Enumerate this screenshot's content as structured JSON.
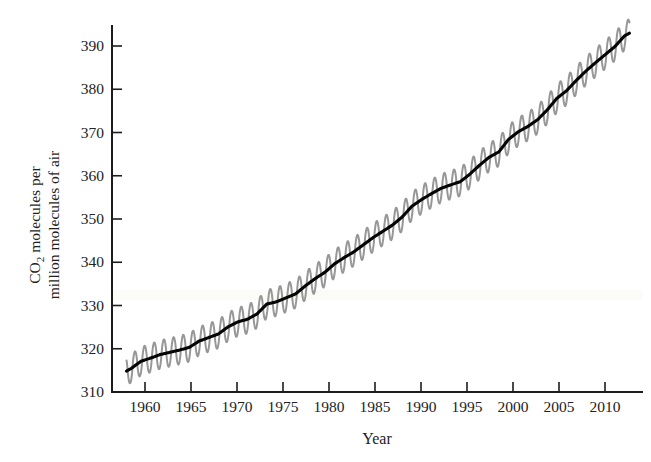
{
  "figure": {
    "background_color": "#ffffff",
    "trend_color": "#050505",
    "seasonal_color": "#8e8e8e",
    "axis_color": "#1c1c1c"
  },
  "labels": {
    "xlabel": "Year",
    "ylabel_line1": "CO2 molecules per",
    "ylabel_line2": "million molecules of air",
    "ylabel_rich_prefix": "CO",
    "ylabel_rich_sub": "2",
    "ylabel_rich_suffix": " molecules per"
  },
  "axes": {
    "y_ticks": [
      310,
      320,
      330,
      340,
      350,
      360,
      370,
      380,
      390
    ],
    "x_ticks": [
      1960,
      1965,
      1970,
      1975,
      1980,
      1985,
      1990,
      1995,
      2000,
      2005,
      2010
    ],
    "xlim": [
      1957.0,
      2011.8
    ],
    "ylim": [
      310,
      392
    ],
    "grid": false,
    "legend": "none"
  },
  "chart_data": {
    "type": "line",
    "title": "",
    "xlabel": "Year",
    "ylabel": "CO2 molecules per million molecules of air",
    "xlim": [
      1957.0,
      2011.8
    ],
    "ylim": [
      310,
      392
    ],
    "grid": false,
    "legend_position": "none",
    "x_tick_labels": [
      "1960",
      "1965",
      "1970",
      "1975",
      "1980",
      "1985",
      "1990",
      "1995",
      "2000",
      "2005",
      "2010"
    ],
    "y_tick_labels": [
      "310",
      "320",
      "330",
      "340",
      "350",
      "360",
      "370",
      "380",
      "390"
    ],
    "seasonal_amplitude_ppm": 3.2,
    "series": [
      {
        "name": "Annual mean trend (smoothed)",
        "style": "solid-black-thick",
        "x": [
          1958.5,
          1959,
          1960,
          1961,
          1962,
          1963,
          1964,
          1965,
          1966,
          1967,
          1968,
          1969,
          1970,
          1971,
          1972,
          1973,
          1974,
          1975,
          1976,
          1977,
          1978,
          1979,
          1980,
          1981,
          1982,
          1983,
          1984,
          1985,
          1986,
          1987,
          1988,
          1989,
          1990,
          1991,
          1992,
          1993,
          1994,
          1995,
          1996,
          1997,
          1998,
          1999,
          2000,
          2001,
          2002,
          2003,
          2004,
          2005,
          2006,
          2007,
          2008,
          2009,
          2010,
          2010.5
        ],
        "values": [
          314.7,
          315.3,
          316.9,
          317.6,
          318.4,
          318.9,
          319.4,
          320.0,
          321.4,
          322.2,
          323.0,
          324.6,
          325.7,
          326.3,
          327.5,
          329.7,
          330.2,
          331.1,
          332.0,
          333.8,
          335.4,
          336.8,
          338.7,
          340.1,
          341.4,
          343.0,
          344.6,
          346.0,
          347.4,
          349.2,
          351.6,
          353.1,
          354.4,
          355.6,
          356.4,
          357.1,
          358.8,
          360.8,
          362.6,
          363.8,
          366.6,
          368.3,
          369.5,
          371.0,
          373.2,
          375.8,
          377.5,
          379.8,
          381.9,
          383.8,
          385.6,
          387.4,
          389.8,
          390.4
        ]
      },
      {
        "name": "Monthly observations (seasonal cycle)",
        "style": "gray-oscillation",
        "description": "Saw-tooth seasonal oscillation of about plus or minus 3.2 ppm around the smoothed trend, peaking in May and bottoming in late September."
      }
    ]
  }
}
